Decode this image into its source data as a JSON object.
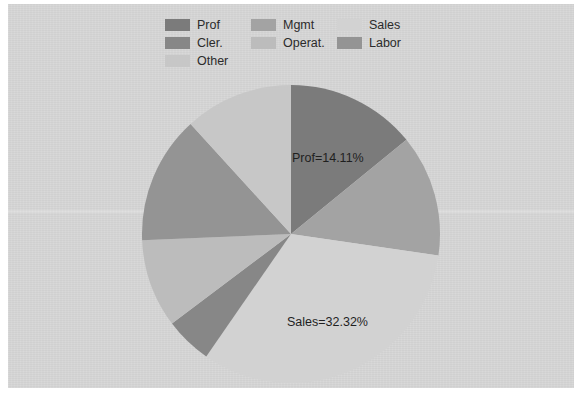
{
  "legend": {
    "items": [
      {
        "label": "Prof",
        "color": "#7b7b7b",
        "order": 0
      },
      {
        "label": "Mgmt",
        "color": "#a3a3a3",
        "order": 1
      },
      {
        "label": "Sales",
        "color": "#d2d2d2",
        "order": 2
      },
      {
        "label": "Cler.",
        "color": "#878787",
        "order": 3
      },
      {
        "label": "Operat.",
        "color": "#bcbcbc",
        "order": 4
      },
      {
        "label": "Labor",
        "color": "#949494",
        "order": 5
      },
      {
        "label": "Other",
        "color": "#c7c7c7",
        "order": 6
      }
    ]
  },
  "labels": {
    "prof": "Prof=14.11%",
    "sales": "Sales=32.32%"
  },
  "colors": {
    "panel_background": "#d6d6d6",
    "page_background": "#ffffff",
    "text": "#1f1f1f"
  },
  "chart_data": {
    "type": "pie",
    "title": "",
    "legend_position": "top",
    "start_angle_deg": 90,
    "direction": "clockwise",
    "categories": [
      "Prof",
      "Mgmt",
      "Sales",
      "Cler.",
      "Operat.",
      "Labor",
      "Other"
    ],
    "values": [
      14.11,
      13.2,
      32.32,
      5.1,
      9.6,
      13.9,
      11.77
    ],
    "unit": "percent",
    "colors": [
      "#7b7b7b",
      "#a3a3a3",
      "#d2d2d2",
      "#878787",
      "#bcbcbc",
      "#949494",
      "#c7c7c7"
    ],
    "annotations": [
      {
        "slice": "Prof",
        "text": "Prof=14.11%",
        "value": 14.11
      },
      {
        "slice": "Sales",
        "text": "Sales=32.32%",
        "value": 32.32
      }
    ]
  }
}
